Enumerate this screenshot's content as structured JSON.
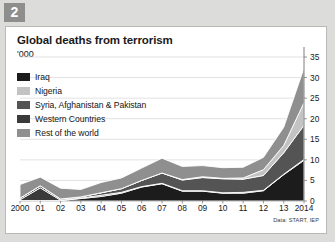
{
  "badge": {
    "number": "2"
  },
  "card": {
    "title": "Global deaths from terrorism",
    "subtitle": "'000",
    "source": "Data: START, IEP"
  },
  "legend": {
    "items": [
      {
        "label": "Iraq",
        "color": "#1c1c1c"
      },
      {
        "label": "Nigeria",
        "color": "#c3c3c3"
      },
      {
        "label": "Syria, Afghanistan & Pakistan",
        "color": "#545454"
      },
      {
        "label": "Western Countries",
        "color": "#3a3a3a"
      },
      {
        "label": "Rest of the world",
        "color": "#8f8f8f"
      }
    ]
  },
  "chart_data": {
    "type": "area",
    "stacked": true,
    "title": "Global deaths from terrorism",
    "subtitle": "'000",
    "xlabel": "",
    "ylabel": "'000",
    "ylim": [
      0,
      35
    ],
    "yticks": [
      0,
      5,
      10,
      15,
      20,
      25,
      30,
      35
    ],
    "ytick_labels": [
      "0",
      "5",
      "10",
      "15",
      "20",
      "25",
      "30",
      "35"
    ],
    "grid": true,
    "legend_position": "top-left",
    "x": [
      2000,
      2001,
      2002,
      2003,
      2004,
      2005,
      2006,
      2007,
      2008,
      2009,
      2010,
      2011,
      2012,
      2013,
      2014
    ],
    "xtick_labels": [
      "2000",
      "01",
      "02",
      "03",
      "04",
      "05",
      "06",
      "07",
      "08",
      "09",
      "10",
      "11",
      "12",
      "13",
      "2014"
    ],
    "series": [
      {
        "name": "Iraq",
        "color": "#1c1c1c",
        "values": [
          0.1,
          0.1,
          0.1,
          0.6,
          1.1,
          1.9,
          3.4,
          4.2,
          2.4,
          2.4,
          1.9,
          1.9,
          2.5,
          6.4,
          9.9
        ]
      },
      {
        "name": "Western Countries",
        "color": "#3a3a3a",
        "values": [
          0.2,
          3.1,
          0.1,
          0.1,
          0.3,
          0.2,
          0.1,
          0.1,
          0.1,
          0.1,
          0.1,
          0.2,
          0.1,
          0.1,
          0.2
        ]
      },
      {
        "name": "Syria, Afghanistan & Pakistan",
        "color": "#545454",
        "values": [
          0.4,
          0.5,
          0.3,
          0.3,
          0.6,
          0.9,
          1.5,
          2.5,
          2.6,
          3.2,
          3.4,
          3.2,
          3.6,
          5.2,
          8.3
        ]
      },
      {
        "name": "Nigeria",
        "color": "#c3c3c3",
        "values": [
          0.0,
          0.0,
          0.0,
          0.0,
          0.0,
          0.0,
          0.0,
          0.0,
          0.1,
          0.2,
          0.1,
          0.3,
          1.4,
          1.8,
          5.5
        ]
      },
      {
        "name": "Rest of the world",
        "color": "#8f8f8f",
        "values": [
          3.3,
          2.1,
          2.6,
          1.8,
          2.5,
          2.6,
          3.0,
          3.6,
          3.2,
          2.7,
          2.6,
          2.6,
          3.0,
          4.4,
          8.4
        ]
      }
    ],
    "totals": [
      4.0,
      5.8,
      3.1,
      2.8,
      4.5,
      5.6,
      8.0,
      10.4,
      8.4,
      8.6,
      8.1,
      8.2,
      10.6,
      17.9,
      32.3
    ],
    "peak": {
      "year": 2014,
      "value": 32.3
    }
  }
}
